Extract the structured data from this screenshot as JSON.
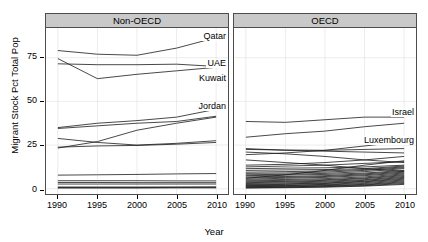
{
  "chart_data": {
    "type": "line",
    "title": "",
    "xlabel": "Year",
    "ylabel": "Migrant Stock Pct Total Pop",
    "x": [
      1990,
      1995,
      2000,
      2005,
      2010
    ],
    "xlim": [
      1988.5,
      2011.5
    ],
    "ylim": [
      -3,
      92
    ],
    "xticks": [
      "1990",
      "1995",
      "2000",
      "2005",
      "2010"
    ],
    "yticks": [
      "0",
      "25",
      "50",
      "75"
    ],
    "ytick_values": [
      0,
      25,
      50,
      75
    ],
    "grid": true,
    "legend": "none",
    "annotations_note": "Selected countries labelled directly on the lines",
    "panels": [
      {
        "name": "Non-OECD",
        "strip_label": "Non-OECD",
        "labelled_series": [
          "Qatar",
          "UAE",
          "Kuwait",
          "Jordan"
        ],
        "series": [
          {
            "name": "Qatar",
            "labelled": true,
            "values": [
              79.1,
              77.0,
              76.4,
              80.5,
              86.5
            ]
          },
          {
            "name": "UAE",
            "labelled": true,
            "values": [
              71.5,
              71.0,
              71.0,
              71.3,
              70.0
            ]
          },
          {
            "name": "Kuwait",
            "labelled": true,
            "values": [
              74.5,
              63.0,
              65.5,
              67.5,
              69.5
            ]
          },
          {
            "name": "Jordan",
            "labelled": true,
            "values": [
              35.0,
              37.5,
              39.0,
              41.0,
              45.5
            ]
          },
          {
            "name": "s5",
            "labelled": false,
            "values": [
              34.5,
              36.0,
              37.5,
              38.5,
              41.5
            ]
          },
          {
            "name": "s6",
            "labelled": false,
            "values": [
              23.3,
              27.0,
              33.5,
              37.5,
              41.0
            ]
          },
          {
            "name": "s7",
            "labelled": false,
            "values": [
              28.8,
              26.5,
              25.0,
              26.0,
              27.5
            ]
          },
          {
            "name": "s8",
            "labelled": false,
            "values": [
              23.8,
              24.5,
              24.8,
              25.5,
              26.5
            ]
          },
          {
            "name": "s9",
            "labelled": false,
            "values": [
              7.8,
              8.0,
              8.2,
              8.5,
              8.7
            ]
          },
          {
            "name": "s10",
            "labelled": false,
            "values": [
              4.6,
              4.6,
              4.6,
              4.5,
              4.5
            ]
          },
          {
            "name": "s11",
            "labelled": false,
            "values": [
              3.6,
              3.6,
              3.5,
              3.5,
              3.5
            ]
          },
          {
            "name": "s12",
            "labelled": false,
            "values": [
              2.7,
              2.7,
              2.7,
              2.7,
              2.7
            ]
          },
          {
            "name": "s13",
            "labelled": false,
            "values": [
              1.0,
              1.0,
              1.0,
              1.0,
              1.1
            ]
          },
          {
            "name": "s14",
            "labelled": false,
            "values": [
              0.7,
              0.7,
              0.7,
              0.8,
              0.8
            ]
          },
          {
            "name": "s15",
            "labelled": false,
            "values": [
              0.4,
              0.4,
              0.4,
              0.5,
              0.5
            ]
          }
        ]
      },
      {
        "name": "OECD",
        "strip_label": "OECD",
        "labelled_series": [
          "Israel",
          "Luxembourg"
        ],
        "series": [
          {
            "name": "Israel",
            "labelled": true,
            "values": [
              38.5,
              38.0,
              39.5,
              41.0,
              41.0
            ]
          },
          {
            "name": "Luxembourg",
            "labelled": true,
            "values": [
              29.5,
              31.5,
              33.0,
              35.5,
              37.5
            ]
          },
          {
            "name": "o3",
            "labelled": false,
            "values": [
              23.0,
              22.0,
              21.5,
              21.0,
              20.5
            ]
          },
          {
            "name": "o4",
            "labelled": false,
            "values": [
              22.5,
              22.2,
              22.0,
              22.5,
              23.0
            ]
          },
          {
            "name": "o5",
            "labelled": false,
            "values": [
              19.5,
              20.5,
              22.0,
              24.5,
              27.0
            ]
          },
          {
            "name": "o6",
            "labelled": false,
            "values": [
              21.0,
              20.0,
              18.5,
              16.5,
              15.0
            ]
          },
          {
            "name": "o7",
            "labelled": false,
            "values": [
              13.5,
              14.0,
              15.0,
              16.5,
              18.5
            ]
          },
          {
            "name": "o8",
            "labelled": false,
            "values": [
              12.5,
              13.0,
              13.5,
              14.5,
              15.5
            ]
          },
          {
            "name": "o9",
            "labelled": false,
            "values": [
              11.5,
              11.8,
              12.0,
              12.5,
              13.5
            ]
          },
          {
            "name": "o10",
            "labelled": false,
            "values": [
              10.5,
              10.8,
              11.0,
              11.5,
              13.0
            ]
          },
          {
            "name": "o11",
            "labelled": false,
            "values": [
              9.5,
              9.8,
              10.2,
              11.0,
              12.5
            ]
          },
          {
            "name": "o12",
            "labelled": false,
            "values": [
              8.8,
              9.0,
              9.5,
              10.5,
              12.0
            ]
          },
          {
            "name": "o13",
            "labelled": false,
            "values": [
              8.0,
              8.3,
              8.8,
              9.8,
              11.5
            ]
          },
          {
            "name": "o14",
            "labelled": false,
            "values": [
              7.5,
              7.8,
              8.2,
              9.0,
              10.5
            ]
          },
          {
            "name": "o15",
            "labelled": false,
            "values": [
              6.8,
              7.0,
              7.5,
              8.5,
              10.0
            ]
          },
          {
            "name": "o16",
            "labelled": false,
            "values": [
              6.2,
              6.5,
              7.0,
              8.0,
              9.5
            ]
          },
          {
            "name": "o17",
            "labelled": false,
            "values": [
              5.5,
              6.0,
              6.5,
              7.5,
              9.0
            ]
          },
          {
            "name": "o18",
            "labelled": false,
            "values": [
              5.0,
              5.3,
              5.8,
              6.8,
              8.5
            ]
          },
          {
            "name": "o19",
            "labelled": false,
            "values": [
              4.5,
              4.8,
              5.2,
              6.2,
              8.0
            ]
          },
          {
            "name": "o20",
            "labelled": false,
            "values": [
              4.0,
              4.2,
              4.8,
              5.8,
              7.5
            ]
          },
          {
            "name": "o21",
            "labelled": false,
            "values": [
              3.5,
              3.8,
              4.3,
              5.2,
              7.0
            ]
          },
          {
            "name": "o22",
            "labelled": false,
            "values": [
              3.0,
              3.3,
              3.8,
              4.8,
              6.5
            ]
          },
          {
            "name": "o23",
            "labelled": false,
            "values": [
              2.5,
              2.8,
              3.3,
              4.3,
              6.0
            ]
          },
          {
            "name": "o24",
            "labelled": false,
            "values": [
              2.2,
              2.5,
              3.0,
              4.0,
              5.5
            ]
          },
          {
            "name": "o25",
            "labelled": false,
            "values": [
              1.8,
              2.0,
              2.5,
              3.5,
              5.0
            ]
          },
          {
            "name": "o26",
            "labelled": false,
            "values": [
              1.5,
              1.8,
              2.2,
              3.0,
              4.5
            ]
          },
          {
            "name": "o27",
            "labelled": false,
            "values": [
              1.2,
              1.4,
              1.8,
              2.5,
              4.0
            ]
          },
          {
            "name": "o28",
            "labelled": false,
            "values": [
              0.9,
              1.1,
              1.5,
              2.2,
              3.5
            ]
          },
          {
            "name": "o29",
            "labelled": false,
            "values": [
              0.6,
              0.8,
              1.2,
              1.8,
              3.0
            ]
          },
          {
            "name": "o30",
            "labelled": false,
            "values": [
              0.4,
              0.6,
              0.9,
              1.5,
              2.5
            ]
          },
          {
            "name": "o31",
            "labelled": false,
            "values": [
              16.5,
              15.0,
              13.5,
              11.5,
              10.0
            ]
          },
          {
            "name": "o32",
            "labelled": false,
            "values": [
              6.0,
              8.0,
              10.5,
              13.5,
              16.0
            ]
          }
        ]
      }
    ]
  },
  "axis": {
    "y_title": "Migrant Stock Pct Total Pop",
    "x_title": "Year",
    "y_tick_labels": [
      "75",
      "50",
      "25",
      "0"
    ],
    "x_tick_labels_left": [
      "1990",
      "1995",
      "2000",
      "2005",
      "2010"
    ],
    "x_tick_labels_right": [
      "1990",
      "1995",
      "2000",
      "2005",
      "2010"
    ]
  },
  "panel_titles": {
    "left": "Non-OECD",
    "right": "OECD"
  },
  "series_labels": {
    "qatar": "Qatar",
    "uae": "UAE",
    "kuwait": "Kuwait",
    "jordan": "Jordan",
    "israel": "Israel",
    "luxembourg": "Luxembourg"
  },
  "colors": {
    "line": "#1a1a1a",
    "strip_bg": "#c9c9c9",
    "panel_border": "#4d4d4d",
    "grid": "#d8d8d8",
    "background": "#ffffff"
  }
}
